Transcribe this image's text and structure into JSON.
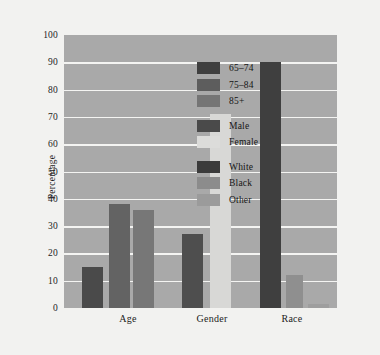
{
  "chart_data": {
    "type": "bar",
    "title": "",
    "xlabel": "",
    "ylabel": "Percentage",
    "ylim": [
      0,
      100
    ],
    "ytick_labels": [
      "100",
      "90",
      "80",
      "70",
      "60",
      "50",
      "40",
      "30",
      "20",
      "10",
      "0"
    ],
    "ytick_values": [
      100,
      90,
      80,
      70,
      60,
      50,
      40,
      30,
      20,
      10,
      0
    ],
    "grid": true,
    "legend_position": "inside-right",
    "categories": [
      "Age",
      "Gender",
      "Race"
    ],
    "groups": [
      {
        "category": "Age",
        "bars": [
          {
            "label": "65-74",
            "value": 15,
            "color": "#4a4a4a"
          },
          {
            "label": "75-84",
            "value": 38,
            "color": "#636363"
          },
          {
            "label": "85+",
            "value": 36,
            "color": "#777777"
          }
        ]
      },
      {
        "category": "Gender",
        "bars": [
          {
            "label": "Male",
            "value": 27,
            "color": "#4e4e4e"
          },
          {
            "label": "Female",
            "value": 71,
            "color": "#d8d8d6"
          }
        ]
      },
      {
        "category": "Race",
        "bars": [
          {
            "label": "White",
            "value": 90,
            "color": "#3f3f3f"
          },
          {
            "label": "Black",
            "value": 12,
            "color": "#8f8f8f"
          },
          {
            "label": "Other",
            "value": 1.5,
            "color": "#9e9e9e"
          }
        ]
      }
    ],
    "legend": [
      {
        "label": "65–74",
        "color": "#3f3f3f",
        "group": 1
      },
      {
        "label": "75–84",
        "color": "#5d5d5d",
        "group": 1
      },
      {
        "label": "85+",
        "color": "#757575",
        "group": 1
      },
      {
        "label": "Male",
        "color": "#4a4a4a",
        "group": 2
      },
      {
        "label": "Female",
        "color": "#dcdcda",
        "group": 2
      },
      {
        "label": "White",
        "color": "#3b3b3b",
        "group": 3
      },
      {
        "label": "Black",
        "color": "#8c8c8c",
        "group": 3
      },
      {
        "label": "Other",
        "color": "#9b9b9b",
        "group": 3
      }
    ],
    "colors": {
      "plot_background": "#a9a9a9",
      "page_background": "#f2f2f0",
      "gridline": "#f4f4f2",
      "text": "#1c1c1c"
    }
  }
}
